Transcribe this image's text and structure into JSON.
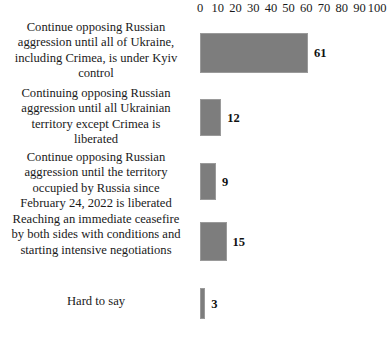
{
  "chart_data": {
    "type": "bar",
    "orientation": "horizontal",
    "title": "",
    "subtitle": "",
    "xlabel": "",
    "ylabel": "",
    "xlim": [
      0,
      100
    ],
    "grid": false,
    "legend": null,
    "bar_color": "#7d7d7d",
    "axis": {
      "position": "top",
      "ticks": [
        0,
        10,
        20,
        30,
        40,
        50,
        60,
        70,
        80,
        90,
        100
      ],
      "tick_labels": [
        "0",
        "10",
        "20",
        "30",
        "40",
        "50",
        "60",
        "70",
        "80",
        "90",
        "100"
      ]
    },
    "categories": [
      "Continue opposing Russian aggression until all of Ukraine, including Crimea, is under Kyiv control",
      "Continuing opposing Russian aggression until all Ukrainian territory except Crimea is liberated",
      "Continue opposing Russian aggression until the territory occupied by Russia since February 24, 2022 is liberated",
      "Reaching an immediate ceasefire by both sides with conditions and starting intensive negotiations",
      "Hard to say"
    ],
    "values": [
      61,
      12,
      9,
      15,
      3
    ],
    "value_labels": [
      "61",
      "12",
      "9",
      "15",
      "3"
    ]
  },
  "rows": [
    {
      "label": "Continue opposing Russian\naggression until all of Ukraine,\nincluding Crimea, is under Kyiv\ncontrol",
      "value": "61"
    },
    {
      "label": "Continuing opposing Russian\naggression until all Ukrainian\nterritory except Crimea is\nliberated",
      "value": "12"
    },
    {
      "label": "Continue opposing Russian\naggression until the territory\noccupied by Russia since\nFebruary 24, 2022 is liberated",
      "value": "9"
    },
    {
      "label": "Reaching an immediate ceasefire\nby both sides with conditions and\nstarting intensive negotiations",
      "value": "15"
    },
    {
      "label": "Hard to say",
      "value": "3"
    }
  ]
}
